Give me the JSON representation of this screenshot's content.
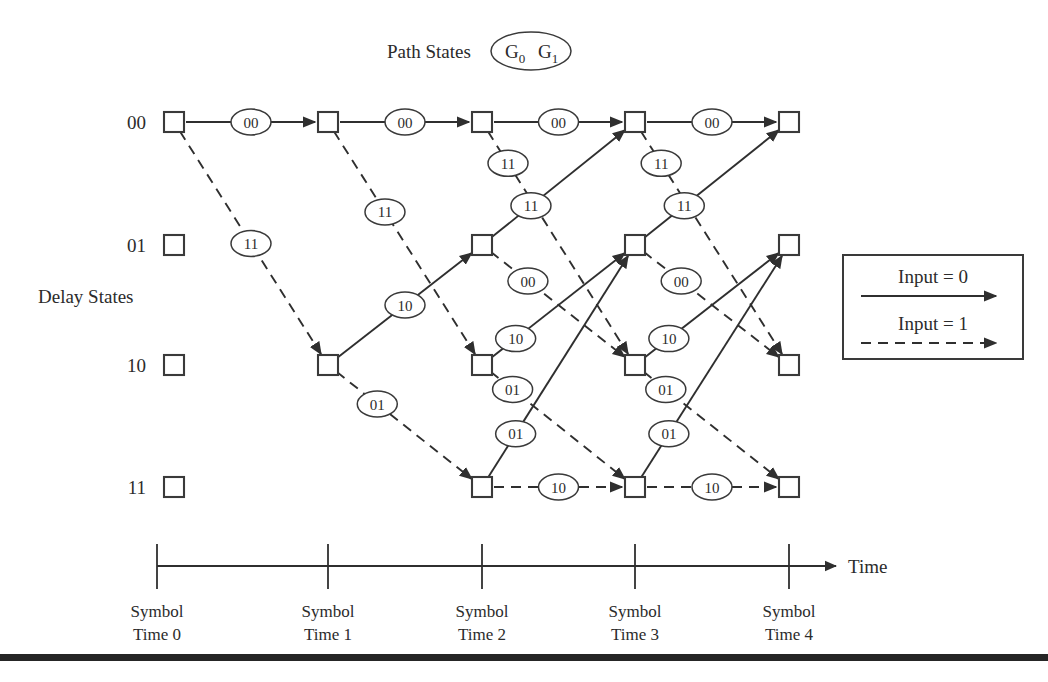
{
  "header": {
    "path_states_label": "Path States",
    "path_states_bubble_g0": "G",
    "path_states_bubble_g0_sub": "0",
    "path_states_bubble_g1": "G",
    "path_states_bubble_g1_sub": "1"
  },
  "side": {
    "delay_states_label": "Delay States"
  },
  "states": [
    {
      "label": "00",
      "row": 0,
      "y": 122
    },
    {
      "label": "01",
      "row": 1,
      "y": 245
    },
    {
      "label": "10",
      "row": 2,
      "y": 365
    },
    {
      "label": "11",
      "row": 3,
      "y": 487
    }
  ],
  "columns": [
    {
      "index": 0,
      "x": 174
    },
    {
      "index": 1,
      "x": 328
    },
    {
      "index": 2,
      "x": 482
    },
    {
      "index": 3,
      "x": 635
    },
    {
      "index": 4,
      "x": 789
    }
  ],
  "legend": {
    "input0_label": "Input = 0",
    "input1_label": "Input = 1",
    "input0_style": "solid",
    "input1_style": "dashed"
  },
  "axis": {
    "time_label": "Time",
    "ticks": [
      {
        "line1": "Symbol",
        "line2": "Time 0",
        "x": 157
      },
      {
        "line1": "Symbol",
        "line2": "Time 1",
        "x": 328
      },
      {
        "line1": "Symbol",
        "line2": "Time 2",
        "x": 482
      },
      {
        "line1": "Symbol",
        "line2": "Time 3",
        "x": 635
      },
      {
        "line1": "Symbol",
        "line2": "Time 4",
        "x": 789
      }
    ]
  },
  "colors": {
    "ink": "#2b2b2b",
    "stroke": "#2f2f2f",
    "node_stroke": "#3a3a3a",
    "background": "#ffffff",
    "rule": "#262626"
  },
  "chart_data": {
    "type": "diagram",
    "state_labels": [
      "00",
      "01",
      "10",
      "11"
    ],
    "nodes": [
      {
        "id": "n0-0",
        "col": 0,
        "row": 0,
        "visible": true
      },
      {
        "id": "n0-1",
        "col": 0,
        "row": 1,
        "visible": true
      },
      {
        "id": "n0-2",
        "col": 0,
        "row": 2,
        "visible": true
      },
      {
        "id": "n0-3",
        "col": 0,
        "row": 3,
        "visible": true
      },
      {
        "id": "n1-0",
        "col": 1,
        "row": 0,
        "visible": true
      },
      {
        "id": "n1-2",
        "col": 1,
        "row": 2,
        "visible": true
      },
      {
        "id": "n2-0",
        "col": 2,
        "row": 0,
        "visible": true
      },
      {
        "id": "n2-1",
        "col": 2,
        "row": 1,
        "visible": true
      },
      {
        "id": "n2-2",
        "col": 2,
        "row": 2,
        "visible": true
      },
      {
        "id": "n2-3",
        "col": 2,
        "row": 3,
        "visible": true
      },
      {
        "id": "n3-0",
        "col": 3,
        "row": 0,
        "visible": true
      },
      {
        "id": "n3-1",
        "col": 3,
        "row": 1,
        "visible": true
      },
      {
        "id": "n3-2",
        "col": 3,
        "row": 2,
        "visible": true
      },
      {
        "id": "n3-3",
        "col": 3,
        "row": 3,
        "visible": true
      },
      {
        "id": "n4-0",
        "col": 4,
        "row": 0,
        "visible": true
      },
      {
        "id": "n4-1",
        "col": 4,
        "row": 1,
        "visible": true
      },
      {
        "id": "n4-2",
        "col": 4,
        "row": 2,
        "visible": true
      },
      {
        "id": "n4-3",
        "col": 4,
        "row": 3,
        "visible": true
      }
    ],
    "edges": [
      {
        "col": 0,
        "from_row": 0,
        "to_row": 0,
        "input": 0,
        "output": "00",
        "style": "solid",
        "label_t": 0.5,
        "label_dx": 0,
        "label_dy": 0
      },
      {
        "col": 0,
        "from_row": 0,
        "to_row": 2,
        "input": 1,
        "output": "11",
        "style": "dashed",
        "label_t": 0.5,
        "label_dx": 0,
        "label_dy": 0
      },
      {
        "col": 1,
        "from_row": 0,
        "to_row": 0,
        "input": 0,
        "output": "00",
        "style": "solid",
        "label_t": 0.5,
        "label_dx": 0,
        "label_dy": 0
      },
      {
        "col": 1,
        "from_row": 0,
        "to_row": 2,
        "input": 1,
        "output": "11",
        "style": "dashed",
        "label_t": 0.37,
        "label_dx": 0,
        "label_dy": 0
      },
      {
        "col": 1,
        "from_row": 2,
        "to_row": 1,
        "input": 0,
        "output": "10",
        "style": "solid",
        "label_t": 0.5,
        "label_dx": 0,
        "label_dy": 0
      },
      {
        "col": 1,
        "from_row": 2,
        "to_row": 3,
        "input": 1,
        "output": "01",
        "style": "dashed",
        "label_t": 0.32,
        "label_dx": 0,
        "label_dy": 0
      },
      {
        "col": 2,
        "from_row": 0,
        "to_row": 0,
        "input": 0,
        "output": "00",
        "style": "solid",
        "label_t": 0.5,
        "label_dx": 0,
        "label_dy": 0
      },
      {
        "col": 2,
        "from_row": 0,
        "to_row": 2,
        "input": 1,
        "output": "11",
        "style": "dashed",
        "label_t": 0.17,
        "label_dx": 0,
        "label_dy": 0
      },
      {
        "col": 2,
        "from_row": 1,
        "to_row": 0,
        "input": 0,
        "output": "11",
        "style": "solid",
        "label_t": 0.32,
        "label_dx": 0,
        "label_dy": 0
      },
      {
        "col": 2,
        "from_row": 1,
        "to_row": 2,
        "input": 1,
        "output": "00",
        "style": "dashed",
        "label_t": 0.3,
        "label_dx": 0,
        "label_dy": 0
      },
      {
        "col": 2,
        "from_row": 2,
        "to_row": 1,
        "input": 0,
        "output": "10",
        "style": "solid",
        "label_t": 0.22,
        "label_dx": 0,
        "label_dy": 0
      },
      {
        "col": 2,
        "from_row": 2,
        "to_row": 3,
        "input": 1,
        "output": "01",
        "style": "dashed",
        "label_t": 0.2,
        "label_dx": 0,
        "label_dy": 0
      },
      {
        "col": 2,
        "from_row": 3,
        "to_row": 1,
        "input": 0,
        "output": "01",
        "style": "solid",
        "label_t": 0.22,
        "label_dx": 0,
        "label_dy": 0
      },
      {
        "col": 2,
        "from_row": 3,
        "to_row": 3,
        "input": 1,
        "output": "10",
        "style": "dashed",
        "label_t": 0.5,
        "label_dx": 0,
        "label_dy": 0
      },
      {
        "col": 3,
        "from_row": 0,
        "to_row": 0,
        "input": 0,
        "output": "00",
        "style": "solid",
        "label_t": 0.5,
        "label_dx": 0,
        "label_dy": 0
      },
      {
        "col": 3,
        "from_row": 0,
        "to_row": 2,
        "input": 1,
        "output": "11",
        "style": "dashed",
        "label_t": 0.17,
        "label_dx": 0,
        "label_dy": 0
      },
      {
        "col": 3,
        "from_row": 1,
        "to_row": 0,
        "input": 0,
        "output": "11",
        "style": "solid",
        "label_t": 0.32,
        "label_dx": 0,
        "label_dy": 0
      },
      {
        "col": 3,
        "from_row": 1,
        "to_row": 2,
        "input": 1,
        "output": "00",
        "style": "dashed",
        "label_t": 0.3,
        "label_dx": 0,
        "label_dy": 0
      },
      {
        "col": 3,
        "from_row": 2,
        "to_row": 1,
        "input": 0,
        "output": "10",
        "style": "solid",
        "label_t": 0.22,
        "label_dx": 0,
        "label_dy": 0
      },
      {
        "col": 3,
        "from_row": 2,
        "to_row": 3,
        "input": 1,
        "output": "01",
        "style": "dashed",
        "label_t": 0.2,
        "label_dx": 0,
        "label_dy": 0
      },
      {
        "col": 3,
        "from_row": 3,
        "to_row": 1,
        "input": 0,
        "output": "01",
        "style": "solid",
        "label_t": 0.22,
        "label_dx": 0,
        "label_dy": 0
      },
      {
        "col": 3,
        "from_row": 3,
        "to_row": 3,
        "input": 1,
        "output": "10",
        "style": "dashed",
        "label_t": 0.5,
        "label_dx": 0,
        "label_dy": 0
      }
    ],
    "legend_entries": [
      {
        "label": "Input = 0",
        "style": "solid"
      },
      {
        "label": "Input = 1",
        "style": "dashed"
      }
    ],
    "x_axis": {
      "label": "Time",
      "ticks": [
        "Symbol Time 0",
        "Symbol Time 1",
        "Symbol Time 2",
        "Symbol Time 3",
        "Symbol Time 4"
      ]
    },
    "y_axis": {
      "label": "Delay States",
      "ticks": [
        "00",
        "01",
        "10",
        "11"
      ]
    }
  }
}
